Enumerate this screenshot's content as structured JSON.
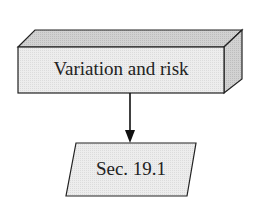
{
  "diagram": {
    "nodes": [
      {
        "id": "variation",
        "shape": "3d-box",
        "label": "Variation and risk",
        "fill": "#ececec",
        "top_fill": "#d6d6d6",
        "side_fill": "#cfcfcf"
      },
      {
        "id": "sec191",
        "shape": "parallelogram",
        "label": "Sec. 19.1",
        "fill": "#ececec"
      }
    ],
    "edges": [
      {
        "from": "variation",
        "to": "sec191",
        "arrow": "down"
      }
    ],
    "stroke_color": "#222222"
  }
}
